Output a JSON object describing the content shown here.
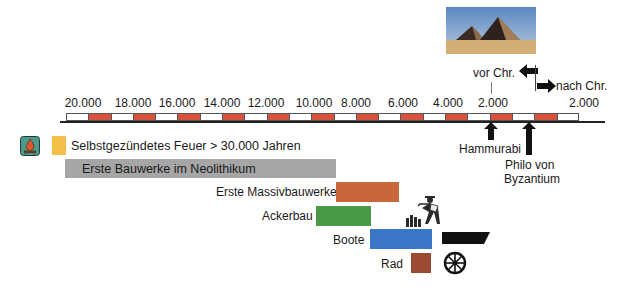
{
  "title_image": {
    "subject": "pyramids-photo"
  },
  "era_labels": {
    "bc": "vor Chr.",
    "ad": "nach Chr."
  },
  "axis": {
    "ticks": [
      {
        "label": "20.000",
        "x": 83
      },
      {
        "label": "18.000",
        "x": 133
      },
      {
        "label": "16.000",
        "x": 177
      },
      {
        "label": "14.000",
        "x": 222
      },
      {
        "label": "12.000",
        "x": 266
      },
      {
        "label": "10.000",
        "x": 314
      },
      {
        "label": "8.000",
        "x": 356
      },
      {
        "label": "6.000",
        "x": 403
      },
      {
        "label": "4.000",
        "x": 448
      },
      {
        "label": "2.000",
        "x": 493
      },
      {
        "label": "2.000",
        "x": 584
      }
    ],
    "segments": [
      "w",
      "r",
      "w",
      "r",
      "w",
      "r",
      "w",
      "r",
      "w",
      "r",
      "w",
      "r",
      "w",
      "r",
      "w",
      "r",
      "w",
      "r",
      "w",
      "r",
      "w",
      "r",
      "w"
    ]
  },
  "markers": [
    {
      "label": "Hammurabi",
      "x": 491
    },
    {
      "label_line1": "Philo von",
      "label_line2": "Byzantium",
      "x": 529
    }
  ],
  "events": [
    {
      "id": "fire",
      "label": "Selbstgezündetes Feuer > 30.000 Jahren",
      "color": "#f5c04a",
      "icon": "fire-icon"
    },
    {
      "id": "neolithic",
      "label": "Erste Bauwerke im Neolithikum",
      "color": "#a6a6a6"
    },
    {
      "id": "massive",
      "label": "Erste Massivbauwerke",
      "color": "#c9663a"
    },
    {
      "id": "agriculture",
      "label": "Ackerbau",
      "color": "#4a9a48",
      "icon": "farmer-icon"
    },
    {
      "id": "boats",
      "label": "Boote",
      "color": "#3a77c6",
      "icon": "boat-icon"
    },
    {
      "id": "wheel",
      "label": "Rad",
      "color": "#9c4a33",
      "icon": "wheel-icon"
    }
  ],
  "colors": {
    "ruler_red": "#d8523d",
    "axis": "#222222"
  }
}
